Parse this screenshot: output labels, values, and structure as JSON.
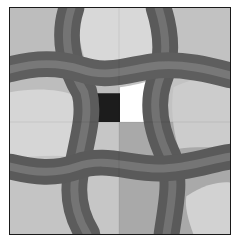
{
  "puzzle": {
    "type": "pattern-tile-grid",
    "grid": {
      "rows": 2,
      "cols": 2
    },
    "colors": {
      "border": "#1a1a1a",
      "band_dark": "#5a5a5a",
      "band_mid": "#6e6e6e",
      "band_light": "#858585",
      "tile_light_a": "#cfcfcf",
      "tile_light_b": "#bdbdbd",
      "tile_light_c": "#b3b3b3",
      "tile_light_d": "#c6c6c6",
      "hole_black": "#1c1c1c",
      "hole_white": "#ffffff"
    },
    "tiles": [
      {
        "position": "top-left"
      },
      {
        "position": "top-right"
      },
      {
        "position": "bottom-left"
      },
      {
        "position": "bottom-right"
      }
    ],
    "highlight_regions": [
      {
        "name": "black-patch",
        "color": "#1c1c1c"
      },
      {
        "name": "white-patch",
        "color": "#ffffff"
      }
    ]
  }
}
